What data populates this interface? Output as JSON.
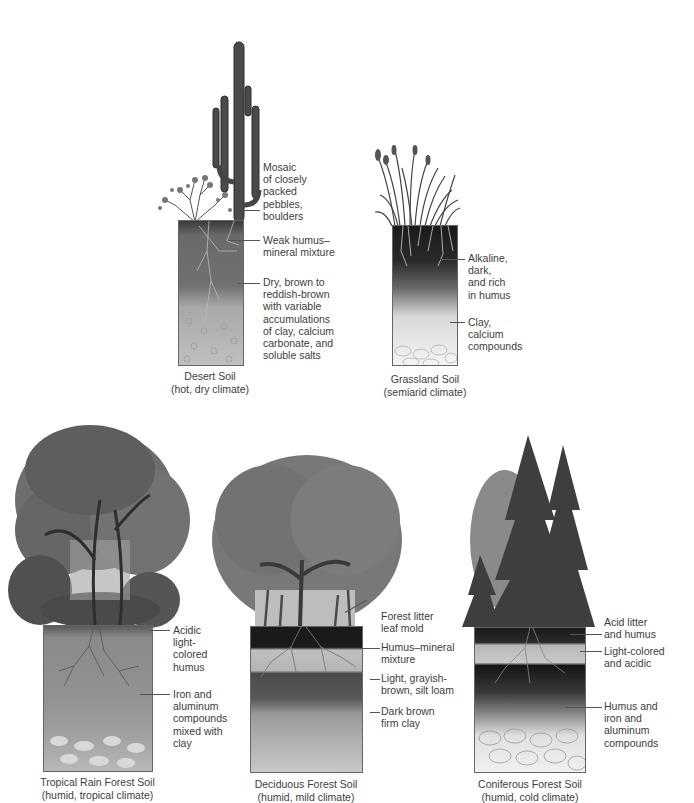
{
  "figure": {
    "panels": [
      {
        "id": "desert",
        "caption_line1": "Desert Soil",
        "caption_line2": "(hot, dry climate)",
        "vegetation": "saguaro cactus and desert shrub",
        "labels": [
          "Mosaic\nof closely\npacked\npebbles,\nboulders",
          "Weak humus–\nmineral mixture",
          "Dry, brown to\nreddish-brown\nwith variable\naccumulations\nof clay, calcium\ncarbonate, and\nsoluble salts"
        ]
      },
      {
        "id": "grassland",
        "caption_line1": "Grassland Soil",
        "caption_line2": "(semiarid climate)",
        "vegetation": "tall grasses",
        "labels": [
          "Alkaline,\ndark,\nand rich\nin humus",
          "Clay,\ncalcium\ncompounds"
        ]
      },
      {
        "id": "tropical",
        "caption_line1": "Tropical Rain Forest Soil",
        "caption_line2": "(humid, tropical climate)",
        "vegetation": "dense rain forest trees with vines",
        "labels": [
          "Acidic\nlight-\ncolored\nhumus",
          "Iron and\naluminum\ncompounds\nmixed with\nclay"
        ]
      },
      {
        "id": "deciduous",
        "caption_line1": "Deciduous Forest Soil",
        "caption_line2": "(humid, mild climate)",
        "vegetation": "broadleaf deciduous trees",
        "labels": [
          "Forest litter\nleaf mold",
          "Humus–mineral\nmixture",
          "Light, grayish-\nbrown, silt loam",
          "Dark brown\nfirm clay"
        ]
      },
      {
        "id": "coniferous",
        "caption_line1": "Coniferous Forest Soil",
        "caption_line2": "(humid, cold climate)",
        "vegetation": "evergreen conifers",
        "labels": [
          "Acid litter\nand humus",
          "Light-colored\nand acidic",
          "Humus and\niron and\naluminum\ncompounds"
        ]
      }
    ]
  },
  "colors": {
    "background": "#ffffff",
    "text": "#3d3d3d",
    "leader": "#555555",
    "dark_soil": "#2a2a2a",
    "mid_soil": "#7a7a7a",
    "light_soil": "#c8c8c8",
    "foliage": "#6a6a6a"
  }
}
